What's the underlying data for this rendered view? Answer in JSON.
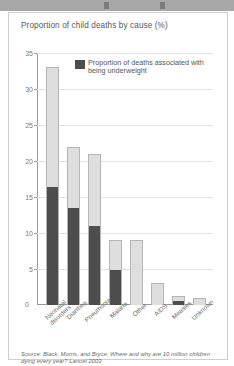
{
  "figure": {
    "title": "Proportion of child deaths by cause (%)",
    "source": "Source: Black, Morris, and Bryce, Where and why are 10 million children dying every year? Lancet 2003",
    "legend": {
      "swatch_color": "#4d4d4d",
      "label": "Proportion of deaths associated with being underweight"
    }
  },
  "chart_data": {
    "type": "bar",
    "title": "Proportion of child deaths by cause (%)",
    "xlabel": "",
    "ylabel": "",
    "ylim": [
      0,
      35
    ],
    "yticks": [
      0,
      5,
      10,
      15,
      20,
      25,
      30,
      35
    ],
    "grid": true,
    "stacked": true,
    "legend_position": "inside-top-right",
    "categories": [
      "Neonatal disorders",
      "Diarrhea",
      "Pneumonia",
      "Malaria",
      "Other",
      "AIDS",
      "Measles",
      "Unknown"
    ],
    "category_lines": [
      [
        "Neonatal",
        "disorders"
      ],
      [
        "Diarrhea"
      ],
      [
        "Pneumonia"
      ],
      [
        "Malaria"
      ],
      [
        "Other"
      ],
      [
        "AIDS"
      ],
      [
        "Measles"
      ],
      [
        "Unknown"
      ]
    ],
    "series": [
      {
        "name": "Proportion of deaths associated with being underweight",
        "color": "#4d4d4d",
        "values": [
          16.5,
          13.5,
          11,
          5,
          0,
          0,
          0.6,
          0
        ]
      },
      {
        "name": "Remaining deaths",
        "color": "#dedede",
        "values": [
          16.5,
          8.5,
          10,
          4,
          9,
          3,
          0.6,
          1
        ]
      }
    ],
    "totals": [
      33,
      22,
      21,
      9,
      9,
      3,
      1.2,
      1
    ]
  }
}
